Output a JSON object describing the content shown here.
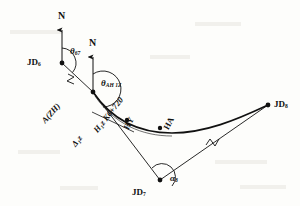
{
  "figure": {
    "kind": "survey-alignment-diagram",
    "background": "#fdfdfb",
    "ink": "#111111"
  },
  "north_arrows": [
    {
      "name": "north-arrow-left",
      "label": "N",
      "x": 62,
      "y": 18,
      "shaft_top": 30,
      "shaft_bottom": 63
    },
    {
      "name": "north-arrow-right",
      "label": "N",
      "x": 93,
      "y": 45,
      "shaft_top": 57,
      "shaft_bottom": 92
    }
  ],
  "points": [
    {
      "id": "JD6",
      "label": "JD",
      "sub": "6",
      "x": 62,
      "y": 63,
      "label_dx": -30,
      "label_dy": -4
    },
    {
      "id": "AZH",
      "label": "A(ZH)",
      "sub": "",
      "x": 93,
      "y": 92,
      "label_dx": -52,
      "label_dy": -8
    },
    {
      "id": "HY",
      "label": "HY",
      "sub": "",
      "x": 127,
      "y": 120,
      "label_dx": 14,
      "label_dy": 2
    },
    {
      "id": "HA",
      "label": "HA",
      "sub": "",
      "x": 160,
      "y": 128,
      "label_dx": 6,
      "label_dy": -14
    },
    {
      "id": "JD7",
      "label": "JD",
      "sub": "7",
      "x": 160,
      "y": 180,
      "label_dx": -26,
      "label_dy": 10
    },
    {
      "id": "JD8",
      "label": "JD",
      "sub": "8",
      "x": 268,
      "y": 105,
      "label_dx": 6,
      "label_dy": 0
    }
  ],
  "angle_labels": [
    {
      "id": "theta-67",
      "glyph": "θ",
      "sub": "67",
      "x": 72,
      "y": 52
    },
    {
      "id": "theta-AH1z",
      "glyph": "θ",
      "sub": "AH 1Z",
      "x": 103,
      "y": 84
    },
    {
      "id": "alpha-8",
      "glyph": "α",
      "sub": "8",
      "x": 172,
      "y": 179
    }
  ],
  "rotated_labels": [
    {
      "id": "label-A-ZH",
      "text": "A(ZH)",
      "x": 42,
      "y": 118,
      "rotate": -48
    },
    {
      "id": "label-H1z",
      "text": "H₁z K6+720",
      "x": 92,
      "y": 128,
      "rotate": -52
    },
    {
      "id": "label-HY",
      "text": "HY",
      "x": 118,
      "y": 124,
      "rotate": -62
    },
    {
      "id": "label-HA",
      "text": "HA",
      "x": 158,
      "y": 124,
      "rotate": -62
    },
    {
      "id": "label-delta",
      "text": "Δ₁z",
      "x": 70,
      "y": 142,
      "rotate": -52
    }
  ],
  "tick_marks": [
    {
      "id": "tick-jd6-a",
      "x": 74,
      "y": 80,
      "rotate": 42
    },
    {
      "id": "tick-jd7-jd8",
      "x": 212,
      "y": 140,
      "rotate": 58
    }
  ],
  "curve": {
    "name": "transition-curve",
    "path": "M 93 92 C 112 120, 140 133, 172 133 C 205 133, 236 120, 268 105"
  },
  "tangent_lines": [
    {
      "id": "tangent-jd6-a",
      "x1": 62,
      "y1": 63,
      "x2": 93,
      "y2": 92
    },
    {
      "id": "tangent-a-jd7",
      "x1": 93,
      "y1": 92,
      "x2": 160,
      "y2": 180
    },
    {
      "id": "tangent-jd7-jd8",
      "x1": 160,
      "y1": 180,
      "x2": 268,
      "y2": 105
    },
    {
      "id": "offset-tick-hy",
      "x1": 92,
      "y1": 112,
      "x2": 133,
      "y2": 131
    }
  ]
}
